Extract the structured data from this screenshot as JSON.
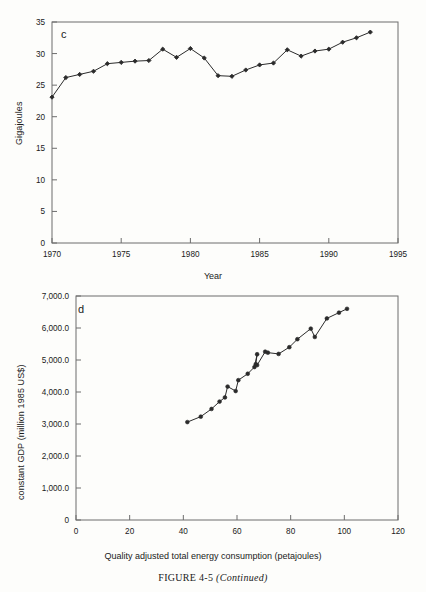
{
  "caption": {
    "figure_number": "FIGURE 4-5",
    "continued": "(Continued)"
  },
  "chart_data": [
    {
      "id": "panel-c",
      "type": "line",
      "panel_letter": "c",
      "title": "",
      "xlabel": "Year",
      "ylabel": "Gigajoules",
      "xlim": [
        1970,
        1995
      ],
      "ylim": [
        0,
        35
      ],
      "xticks": [
        1970,
        1975,
        1980,
        1985,
        1990,
        1995
      ],
      "yticks": [
        0,
        5,
        10,
        15,
        20,
        25,
        30,
        35
      ],
      "grid": false,
      "legend": "none",
      "marker": "filled-diamond",
      "x": [
        1970,
        1971,
        1972,
        1973,
        1974,
        1975,
        1976,
        1977,
        1978,
        1979,
        1980,
        1981,
        1982,
        1983,
        1984,
        1985,
        1986,
        1987,
        1988,
        1989,
        1990,
        1991,
        1992,
        1993
      ],
      "values": [
        23.1,
        26.2,
        26.7,
        27.2,
        28.4,
        28.6,
        28.8,
        28.9,
        30.7,
        29.4,
        30.8,
        29.3,
        26.5,
        26.4,
        27.4,
        28.2,
        28.5,
        30.6,
        29.6,
        30.4,
        30.7,
        31.8,
        32.5,
        33.4
      ]
    },
    {
      "id": "panel-d",
      "type": "scatter",
      "panel_letter": "d",
      "title": "",
      "xlabel": "Quality adjusted total energy consumption (petajoules)",
      "ylabel": "constant GDP (million 1985 US$)",
      "xlim": [
        0,
        120
      ],
      "ylim": [
        0,
        7000
      ],
      "xticks": [
        0,
        20,
        40,
        60,
        80,
        100,
        120
      ],
      "ytick_labels": [
        "0",
        "1,000.0",
        "2,000.0",
        "3,000.0",
        "4,000.0",
        "5,000.0",
        "6,000.0",
        "7,000.0"
      ],
      "yticks": [
        0,
        1000,
        2000,
        3000,
        4000,
        5000,
        6000,
        7000
      ],
      "grid": false,
      "legend": "none",
      "marker": "filled-circle",
      "connected": true,
      "annotations": [
        {
          "label": "1970",
          "x": 33.5,
          "y": 3380
        },
        {
          "label": "1991",
          "x": 103.0,
          "y": 6230
        }
      ],
      "points": [
        {
          "year": 1970,
          "x": 41.5,
          "y": 3060
        },
        {
          "year": 1971,
          "x": 46.5,
          "y": 3230
        },
        {
          "year": 1972,
          "x": 50.5,
          "y": 3470
        },
        {
          "year": 1973,
          "x": 53.5,
          "y": 3700
        },
        {
          "year": 1974,
          "x": 55.5,
          "y": 3830
        },
        {
          "year": 1975,
          "x": 56.5,
          "y": 4170
        },
        {
          "year": 1976,
          "x": 59.5,
          "y": 4030
        },
        {
          "year": 1977,
          "x": 60.5,
          "y": 4370
        },
        {
          "year": 1978,
          "x": 64.0,
          "y": 4570
        },
        {
          "year": 1979,
          "x": 66.5,
          "y": 4780
        },
        {
          "year": 1980,
          "x": 67.5,
          "y": 5180
        },
        {
          "year": 1981,
          "x": 67.0,
          "y": 4870
        },
        {
          "year": 1982,
          "x": 67.5,
          "y": 4840
        },
        {
          "year": 1983,
          "x": 70.5,
          "y": 5260
        },
        {
          "year": 1984,
          "x": 71.5,
          "y": 5230
        },
        {
          "year": 1985,
          "x": 75.5,
          "y": 5190
        },
        {
          "year": 1986,
          "x": 79.5,
          "y": 5400
        },
        {
          "year": 1987,
          "x": 82.5,
          "y": 5650
        },
        {
          "year": 1988,
          "x": 87.5,
          "y": 5980
        },
        {
          "year": 1989,
          "x": 89.0,
          "y": 5720
        },
        {
          "year": 1990,
          "x": 93.5,
          "y": 6300
        },
        {
          "year": 1991,
          "x": 98.0,
          "y": 6480
        },
        {
          "year": 1992,
          "x": 101.0,
          "y": 6600
        }
      ]
    }
  ]
}
